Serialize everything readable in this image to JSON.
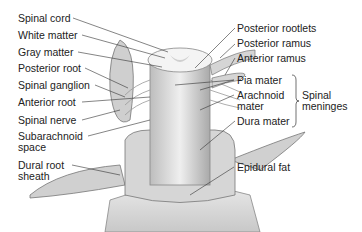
{
  "diagram": {
    "labels_left": [
      {
        "id": "spinal-cord",
        "text": "Spinal cord"
      },
      {
        "id": "white-matter",
        "text": "White matter"
      },
      {
        "id": "gray-matter",
        "text": "Gray matter"
      },
      {
        "id": "posterior-root",
        "text": "Posterior root"
      },
      {
        "id": "spinal-ganglion",
        "text": "Spinal ganglion"
      },
      {
        "id": "anterior-root",
        "text": "Anterior root"
      },
      {
        "id": "spinal-nerve",
        "text": "Spinal nerve"
      },
      {
        "id": "subarachnoid-space",
        "text": "Subarachnoid space"
      },
      {
        "id": "dural-root-sheath",
        "text": "Dural root sheath"
      }
    ],
    "labels_right": [
      {
        "id": "posterior-rootlets",
        "text": "Posterior rootlets"
      },
      {
        "id": "posterior-ramus",
        "text": "Posterior ramus"
      },
      {
        "id": "anterior-ramus",
        "text": "Anterior ramus"
      },
      {
        "id": "pia-mater",
        "text": "Pia mater"
      },
      {
        "id": "arachnoid-mater",
        "text": "Arachnoid mater"
      },
      {
        "id": "dura-mater",
        "text": "Dura mater"
      },
      {
        "id": "epidural-fat",
        "text": "Epidural fat"
      }
    ],
    "group_label": "Spinal meninges"
  }
}
